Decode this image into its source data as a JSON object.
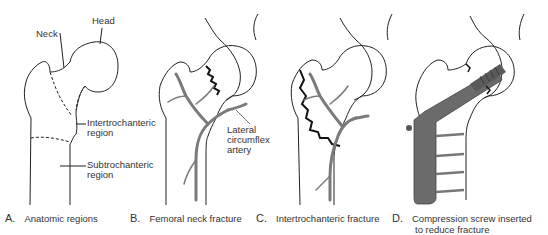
{
  "panels": [
    {
      "id": "A",
      "letter": "A.",
      "caption": "Anatomic regions",
      "labels": {
        "head": "Head",
        "neck": "Neck",
        "intertrochanteric_1": "Intertrochanteric",
        "intertrochanteric_2": "region",
        "subtrochanteric_1": "Subtrochanteric",
        "subtrochanteric_2": "region"
      }
    },
    {
      "id": "B",
      "letter": "B.",
      "caption": "Femoral neck fracture",
      "labels": {
        "artery_1": "Lateral",
        "artery_2": "circumflex",
        "artery_3": "artery"
      }
    },
    {
      "id": "C",
      "letter": "C.",
      "caption": "Intertrochanteric fracture",
      "labels": {}
    },
    {
      "id": "D",
      "letter": "D.",
      "caption_line1": "Compression screw inserted",
      "caption_line2": "to reduce fracture",
      "labels": {}
    }
  ],
  "colors": {
    "outline": "#222222",
    "artery": "#7a7a7a",
    "implant": "#6b6b6b",
    "fracture": "#111111"
  }
}
